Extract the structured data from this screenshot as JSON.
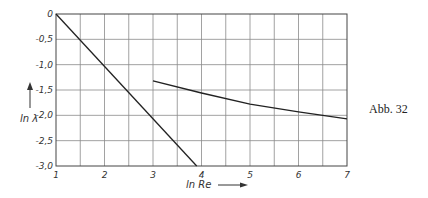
{
  "caption": "Abb. 32",
  "chart_data": {
    "type": "line",
    "title": "",
    "xlabel": "ln Re",
    "ylabel": "ln λ",
    "xlim": [
      1,
      7
    ],
    "ylim": [
      -3.0,
      0
    ],
    "xticks": [
      "1",
      "2",
      "3",
      "4",
      "5",
      "6",
      "7"
    ],
    "yticks": [
      "0",
      "-0,5",
      "-1,0",
      "-1,5",
      "-2,0",
      "-2,5",
      "-3,0"
    ],
    "grid": true,
    "grid_x_step": 0.5,
    "grid_y_step": 0.5,
    "legend": null,
    "series": [
      {
        "name": "laminar (straight line)",
        "x": [
          1.0,
          3.9
        ],
        "y": [
          0.0,
          -3.0
        ]
      },
      {
        "name": "turbulent (curve)",
        "x": [
          3.0,
          4.0,
          5.0,
          6.0,
          6.5,
          7.0
        ],
        "y": [
          -1.32,
          -1.56,
          -1.78,
          -1.93,
          -2.0,
          -2.07
        ]
      }
    ]
  }
}
